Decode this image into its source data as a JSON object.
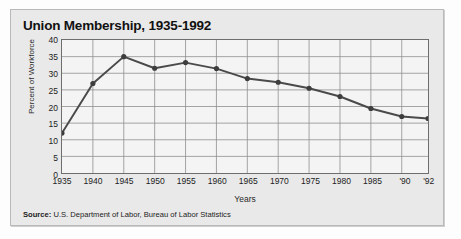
{
  "title": "Union Membership, 1935-1992",
  "source_prefix": "Source:",
  "source_text": "U.S. Department of Labor, Bureau of Labor Statistics",
  "colors": {
    "line": "#4a4a4a",
    "marker": "#3d3d3d",
    "grid": "#8e8e8e",
    "plot_background": "#f4f4f4",
    "card_background": "#e9e9e9",
    "axis": "#6e6e6e",
    "text": "#111111"
  },
  "chart_data": {
    "type": "line",
    "title": "Union Membership, 1935-1992",
    "xlabel": "Years",
    "ylabel": "Percent of Workforce",
    "ylim": [
      0,
      40
    ],
    "ytick_step": 5,
    "yticks": [
      0,
      5,
      10,
      15,
      20,
      25,
      30,
      35,
      40
    ],
    "grid": true,
    "legend": "none",
    "xtick_labels": [
      "1935",
      "1940",
      "1945",
      "1950",
      "1955",
      "1960",
      "1965",
      "1970",
      "1975",
      "1980",
      "1985",
      "'90",
      "'92"
    ],
    "x": [
      1935,
      1940,
      1945,
      1950,
      1955,
      1960,
      1965,
      1970,
      1975,
      1980,
      1985,
      1990,
      1992
    ],
    "values": [
      12.0,
      26.9,
      35.0,
      31.5,
      33.2,
      31.4,
      28.4,
      27.3,
      25.5,
      23.0,
      19.4,
      17.0,
      16.4
    ],
    "series": [
      {
        "name": "Percent of Workforce",
        "values": [
          12.0,
          26.9,
          35.0,
          31.5,
          33.2,
          31.4,
          28.4,
          27.3,
          25.5,
          23.0,
          19.4,
          17.0,
          16.4
        ]
      }
    ],
    "annotations": []
  }
}
